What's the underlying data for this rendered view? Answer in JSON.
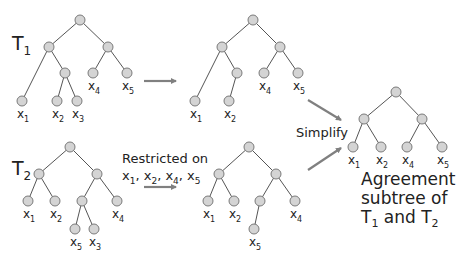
{
  "diagram": {
    "title_cut_off": "",
    "trees": [
      {
        "id": "T1",
        "label": {
          "main": "T",
          "sub": "1"
        },
        "label_pos": [
          12,
          50
        ],
        "nodes": [
          {
            "id": "r",
            "x": 80,
            "y": 20
          },
          {
            "id": "a",
            "x": 49,
            "y": 47
          },
          {
            "id": "b",
            "x": 108,
            "y": 47
          },
          {
            "id": "c",
            "x": 65,
            "y": 73
          },
          {
            "id": "x4",
            "x": 93,
            "y": 73,
            "label": {
              "main": "x",
              "sub": "4"
            }
          },
          {
            "id": "x5",
            "x": 127,
            "y": 73,
            "label": {
              "main": "x",
              "sub": "5"
            }
          },
          {
            "id": "x1",
            "x": 22,
            "y": 101,
            "label": {
              "main": "x",
              "sub": "1"
            }
          },
          {
            "id": "x2",
            "x": 57,
            "y": 101,
            "label": {
              "main": "x",
              "sub": "2"
            }
          },
          {
            "id": "x3",
            "x": 77,
            "y": 101,
            "label": {
              "main": "x",
              "sub": "3"
            }
          }
        ],
        "edges": [
          [
            "r",
            "a"
          ],
          [
            "r",
            "b"
          ],
          [
            "a",
            "x1"
          ],
          [
            "a",
            "c"
          ],
          [
            "c",
            "x2"
          ],
          [
            "c",
            "x3"
          ],
          [
            "b",
            "x4"
          ],
          [
            "b",
            "x5"
          ]
        ]
      },
      {
        "id": "T1-restricted",
        "nodes": [
          {
            "id": "r",
            "x": 253,
            "y": 20
          },
          {
            "id": "a",
            "x": 222,
            "y": 47
          },
          {
            "id": "b",
            "x": 280,
            "y": 47
          },
          {
            "id": "c",
            "x": 237,
            "y": 73
          },
          {
            "id": "x4",
            "x": 264,
            "y": 73,
            "label": {
              "main": "x",
              "sub": "4"
            }
          },
          {
            "id": "x5",
            "x": 298,
            "y": 73,
            "label": {
              "main": "x",
              "sub": "5"
            }
          },
          {
            "id": "x1",
            "x": 195,
            "y": 101,
            "label": {
              "main": "x",
              "sub": "1"
            }
          },
          {
            "id": "x2",
            "x": 229,
            "y": 101,
            "label": {
              "main": "x",
              "sub": "2"
            }
          }
        ],
        "edges": [
          [
            "r",
            "a"
          ],
          [
            "r",
            "b"
          ],
          [
            "a",
            "x1"
          ],
          [
            "a",
            "c"
          ],
          [
            "c",
            "x2"
          ],
          [
            "b",
            "x4"
          ],
          [
            "b",
            "x5"
          ]
        ]
      },
      {
        "id": "T2",
        "label": {
          "main": "T",
          "sub": "2"
        },
        "label_pos": [
          12,
          175
        ],
        "nodes": [
          {
            "id": "r",
            "x": 70,
            "y": 147
          },
          {
            "id": "a",
            "x": 39,
            "y": 174
          },
          {
            "id": "b",
            "x": 97,
            "y": 174
          },
          {
            "id": "x1",
            "x": 28,
            "y": 201,
            "label": {
              "main": "x",
              "sub": "1"
            }
          },
          {
            "id": "x2",
            "x": 55,
            "y": 201,
            "label": {
              "main": "x",
              "sub": "2"
            }
          },
          {
            "id": "c",
            "x": 82,
            "y": 201
          },
          {
            "id": "x4",
            "x": 117,
            "y": 201,
            "label": {
              "main": "x",
              "sub": "4"
            }
          },
          {
            "id": "x5",
            "x": 75,
            "y": 229,
            "label": {
              "main": "x",
              "sub": "5"
            }
          },
          {
            "id": "x3",
            "x": 94,
            "y": 229,
            "label": {
              "main": "x",
              "sub": "3"
            }
          }
        ],
        "edges": [
          [
            "r",
            "a"
          ],
          [
            "r",
            "b"
          ],
          [
            "a",
            "x1"
          ],
          [
            "a",
            "x2"
          ],
          [
            "b",
            "c"
          ],
          [
            "b",
            "x4"
          ],
          [
            "c",
            "x5"
          ],
          [
            "c",
            "x3"
          ]
        ]
      },
      {
        "id": "T2-restricted",
        "nodes": [
          {
            "id": "r",
            "x": 249,
            "y": 147
          },
          {
            "id": "a",
            "x": 219,
            "y": 174
          },
          {
            "id": "b",
            "x": 276,
            "y": 174
          },
          {
            "id": "x1",
            "x": 208,
            "y": 201,
            "label": {
              "main": "x",
              "sub": "1"
            }
          },
          {
            "id": "x2",
            "x": 234,
            "y": 201,
            "label": {
              "main": "x",
              "sub": "2"
            }
          },
          {
            "id": "c",
            "x": 260,
            "y": 201
          },
          {
            "id": "x4",
            "x": 295,
            "y": 201,
            "label": {
              "main": "x",
              "sub": "4"
            }
          },
          {
            "id": "x5",
            "x": 254,
            "y": 229,
            "label": {
              "main": "x",
              "sub": "5"
            }
          }
        ],
        "edges": [
          [
            "r",
            "a"
          ],
          [
            "r",
            "b"
          ],
          [
            "a",
            "x1"
          ],
          [
            "a",
            "x2"
          ],
          [
            "b",
            "c"
          ],
          [
            "b",
            "x4"
          ],
          [
            "c",
            "x5"
          ]
        ]
      },
      {
        "id": "agreement",
        "nodes": [
          {
            "id": "r",
            "x": 396,
            "y": 92
          },
          {
            "id": "a",
            "x": 364,
            "y": 119
          },
          {
            "id": "b",
            "x": 422,
            "y": 119
          },
          {
            "id": "x1",
            "x": 353,
            "y": 147,
            "label": {
              "main": "x",
              "sub": "1"
            }
          },
          {
            "id": "x2",
            "x": 381,
            "y": 147,
            "label": {
              "main": "x",
              "sub": "2"
            }
          },
          {
            "id": "x4",
            "x": 407,
            "y": 147,
            "label": {
              "main": "x",
              "sub": "4"
            }
          },
          {
            "id": "x5",
            "x": 442,
            "y": 147,
            "label": {
              "main": "x",
              "sub": "5"
            }
          }
        ],
        "edges": [
          [
            "r",
            "a"
          ],
          [
            "r",
            "b"
          ],
          [
            "a",
            "x1"
          ],
          [
            "a",
            "x2"
          ],
          [
            "b",
            "x4"
          ],
          [
            "b",
            "x5"
          ]
        ]
      }
    ],
    "arrows": [
      {
        "id": "restrict-T1",
        "from": [
          144,
          81
        ],
        "to": [
          176,
          81
        ]
      },
      {
        "id": "restrict-T2",
        "from": [
          144,
          187
        ],
        "to": [
          176,
          187
        ]
      },
      {
        "id": "simplify-T1",
        "from": [
          308,
          100
        ],
        "to": [
          341,
          120
        ]
      },
      {
        "id": "simplify-T2",
        "from": [
          308,
          170
        ],
        "to": [
          341,
          148
        ]
      }
    ],
    "restricted_caption": {
      "line1": "Restricted on",
      "line2": [
        {
          "main": "x",
          "sub": "1",
          "sep": ", "
        },
        {
          "main": "x",
          "sub": "2",
          "sep": ", "
        },
        {
          "main": "x",
          "sub": "4",
          "sep": ", "
        },
        {
          "main": "x",
          "sub": "5",
          "sep": ""
        }
      ]
    },
    "simplify_label": "Simplify",
    "result_caption": {
      "line1": "Agreement",
      "line2": "subtree of",
      "line3_parts": [
        {
          "main": "T",
          "sub": "1"
        },
        {
          "text": " and "
        },
        {
          "main": "T",
          "sub": "2"
        }
      ]
    },
    "colors": {
      "node_fill": "#d4d4d4",
      "node_stroke": "#7a7a7a",
      "edge": "#555555",
      "arrow": "#808080",
      "text": "#222222"
    }
  }
}
